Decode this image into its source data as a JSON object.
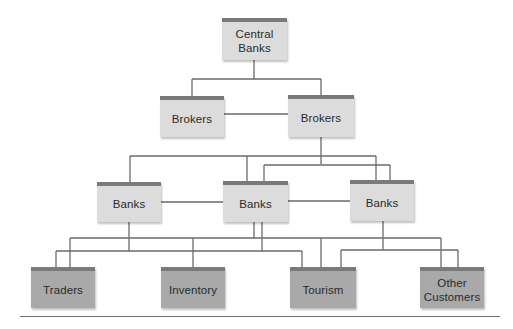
{
  "diagram": {
    "type": "hierarchy-network",
    "colors": {
      "node_light_fill": "#dcdcdc",
      "node_dark_fill": "#a9a9a9",
      "node_top_bar": "#7a7a7a",
      "connector": "#6a6a6a",
      "text": "#2a2a2a"
    },
    "levels": [
      {
        "name": "level-1",
        "nodes": [
          {
            "id": "central-banks",
            "label_line1": "Central",
            "label_line2": "Banks"
          }
        ]
      },
      {
        "name": "level-2",
        "nodes": [
          {
            "id": "brokers-left",
            "label": "Brokers"
          },
          {
            "id": "brokers-right",
            "label": "Brokers"
          }
        ]
      },
      {
        "name": "level-3",
        "nodes": [
          {
            "id": "banks-left",
            "label": "Banks"
          },
          {
            "id": "banks-middle",
            "label": "Banks"
          },
          {
            "id": "banks-right",
            "label": "Banks"
          }
        ]
      },
      {
        "name": "level-4",
        "nodes": [
          {
            "id": "traders",
            "label": "Traders"
          },
          {
            "id": "inventory",
            "label": "Inventory"
          },
          {
            "id": "tourism",
            "label": "Tourism"
          },
          {
            "id": "other-customers",
            "label_line1": "Other",
            "label_line2": "Customers"
          }
        ]
      }
    ],
    "edges": [
      [
        "central-banks",
        "brokers-left"
      ],
      [
        "central-banks",
        "brokers-right"
      ],
      [
        "brokers-left",
        "brokers-right"
      ],
      [
        "brokers-right",
        "banks-left"
      ],
      [
        "brokers-right",
        "banks-middle"
      ],
      [
        "brokers-right",
        "banks-right"
      ],
      [
        "banks-left",
        "banks-middle"
      ],
      [
        "banks-middle",
        "banks-right"
      ],
      [
        "banks-left",
        "traders"
      ],
      [
        "banks-left",
        "tourism"
      ],
      [
        "banks-middle",
        "traders"
      ],
      [
        "banks-middle",
        "inventory"
      ],
      [
        "banks-middle",
        "tourism"
      ],
      [
        "banks-middle",
        "other-customers"
      ],
      [
        "banks-right",
        "tourism"
      ],
      [
        "banks-right",
        "other-customers"
      ]
    ]
  }
}
